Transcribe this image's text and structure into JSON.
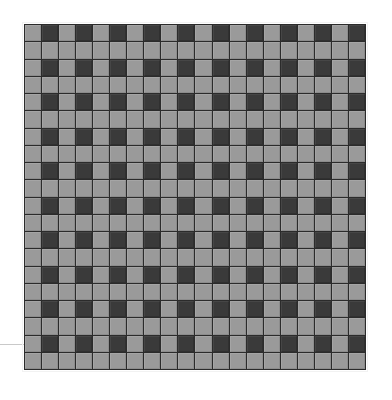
{
  "figure": {
    "background_color": "#ffffff"
  },
  "margin_rule": {
    "name": "horizontal rule",
    "color": "#c9c9c9",
    "x": 0,
    "y": 344,
    "width": 24,
    "height": 1
  },
  "grid": {
    "name": "checkerboard",
    "x": 24,
    "y": 24,
    "width": 342,
    "height": 346,
    "rows": 20,
    "columns": 20,
    "gap_px": 1,
    "gap_color": "#2b2b2b",
    "light_color": "#9a9a9a",
    "dark_color": "#3a3a3a",
    "pattern_rule": "dark when (row mod 2 == 0) and (column mod 2 == 1), otherwise light",
    "cells": [
      [
        "light",
        "dark",
        "light",
        "dark",
        "light",
        "dark",
        "light",
        "dark",
        "light",
        "dark",
        "light",
        "dark",
        "light",
        "dark",
        "light",
        "dark",
        "light",
        "dark",
        "light",
        "dark"
      ],
      [
        "light",
        "light",
        "light",
        "light",
        "light",
        "light",
        "light",
        "light",
        "light",
        "light",
        "light",
        "light",
        "light",
        "light",
        "light",
        "light",
        "light",
        "light",
        "light",
        "light"
      ],
      [
        "light",
        "dark",
        "light",
        "dark",
        "light",
        "dark",
        "light",
        "dark",
        "light",
        "dark",
        "light",
        "dark",
        "light",
        "dark",
        "light",
        "dark",
        "light",
        "dark",
        "light",
        "dark"
      ],
      [
        "light",
        "light",
        "light",
        "light",
        "light",
        "light",
        "light",
        "light",
        "light",
        "light",
        "light",
        "light",
        "light",
        "light",
        "light",
        "light",
        "light",
        "light",
        "light",
        "light"
      ],
      [
        "light",
        "dark",
        "light",
        "dark",
        "light",
        "dark",
        "light",
        "dark",
        "light",
        "dark",
        "light",
        "dark",
        "light",
        "dark",
        "light",
        "dark",
        "light",
        "dark",
        "light",
        "dark"
      ],
      [
        "light",
        "light",
        "light",
        "light",
        "light",
        "light",
        "light",
        "light",
        "light",
        "light",
        "light",
        "light",
        "light",
        "light",
        "light",
        "light",
        "light",
        "light",
        "light",
        "light"
      ],
      [
        "light",
        "dark",
        "light",
        "dark",
        "light",
        "dark",
        "light",
        "dark",
        "light",
        "dark",
        "light",
        "dark",
        "light",
        "dark",
        "light",
        "dark",
        "light",
        "dark",
        "light",
        "dark"
      ],
      [
        "light",
        "light",
        "light",
        "light",
        "light",
        "light",
        "light",
        "light",
        "light",
        "light",
        "light",
        "light",
        "light",
        "light",
        "light",
        "light",
        "light",
        "light",
        "light",
        "light"
      ],
      [
        "light",
        "dark",
        "light",
        "dark",
        "light",
        "dark",
        "light",
        "dark",
        "light",
        "dark",
        "light",
        "dark",
        "light",
        "dark",
        "light",
        "dark",
        "light",
        "dark",
        "light",
        "dark"
      ],
      [
        "light",
        "light",
        "light",
        "light",
        "light",
        "light",
        "light",
        "light",
        "light",
        "light",
        "light",
        "light",
        "light",
        "light",
        "light",
        "light",
        "light",
        "light",
        "light",
        "light"
      ],
      [
        "light",
        "dark",
        "light",
        "dark",
        "light",
        "dark",
        "light",
        "dark",
        "light",
        "dark",
        "light",
        "dark",
        "light",
        "dark",
        "light",
        "dark",
        "light",
        "dark",
        "light",
        "dark"
      ],
      [
        "light",
        "light",
        "light",
        "light",
        "light",
        "light",
        "light",
        "light",
        "light",
        "light",
        "light",
        "light",
        "light",
        "light",
        "light",
        "light",
        "light",
        "light",
        "light",
        "light"
      ],
      [
        "light",
        "dark",
        "light",
        "dark",
        "light",
        "dark",
        "light",
        "dark",
        "light",
        "dark",
        "light",
        "dark",
        "light",
        "dark",
        "light",
        "dark",
        "light",
        "dark",
        "light",
        "dark"
      ],
      [
        "light",
        "light",
        "light",
        "light",
        "light",
        "light",
        "light",
        "light",
        "light",
        "light",
        "light",
        "light",
        "light",
        "light",
        "light",
        "light",
        "light",
        "light",
        "light",
        "light"
      ],
      [
        "light",
        "dark",
        "light",
        "dark",
        "light",
        "dark",
        "light",
        "dark",
        "light",
        "dark",
        "light",
        "dark",
        "light",
        "dark",
        "light",
        "dark",
        "light",
        "dark",
        "light",
        "dark"
      ],
      [
        "light",
        "light",
        "light",
        "light",
        "light",
        "light",
        "light",
        "light",
        "light",
        "light",
        "light",
        "light",
        "light",
        "light",
        "light",
        "light",
        "light",
        "light",
        "light",
        "light"
      ],
      [
        "light",
        "dark",
        "light",
        "dark",
        "light",
        "dark",
        "light",
        "dark",
        "light",
        "dark",
        "light",
        "dark",
        "light",
        "dark",
        "light",
        "dark",
        "light",
        "dark",
        "light",
        "dark"
      ],
      [
        "light",
        "light",
        "light",
        "light",
        "light",
        "light",
        "light",
        "light",
        "light",
        "light",
        "light",
        "light",
        "light",
        "light",
        "light",
        "light",
        "light",
        "light",
        "light",
        "light"
      ],
      [
        "light",
        "dark",
        "light",
        "dark",
        "light",
        "dark",
        "light",
        "dark",
        "light",
        "dark",
        "light",
        "dark",
        "light",
        "dark",
        "light",
        "dark",
        "light",
        "dark",
        "light",
        "dark"
      ],
      [
        "light",
        "light",
        "light",
        "light",
        "light",
        "light",
        "light",
        "light",
        "light",
        "light",
        "light",
        "light",
        "light",
        "light",
        "light",
        "light",
        "light",
        "light",
        "light",
        "light"
      ]
    ]
  }
}
